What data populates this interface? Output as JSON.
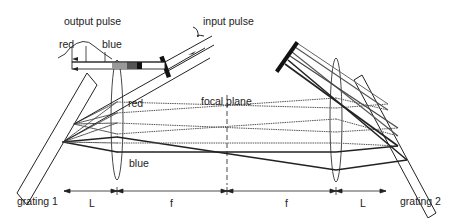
{
  "diagram": {
    "type": "optical-schematic",
    "labels": {
      "output_pulse": "output pulse",
      "input_pulse": "input pulse",
      "red_output": "red",
      "blue_output": "blue",
      "red_beam": "red",
      "blue_beam": "blue",
      "focal_plane": "focal plane",
      "grating_1": "grating 1",
      "grating_2": "grating 2",
      "dim_L_left": "L",
      "dim_f_left": "f",
      "dim_f_right": "f",
      "dim_L_right": "L"
    },
    "components": [
      {
        "id": "grating-1",
        "kind": "diffraction grating"
      },
      {
        "id": "lens-1",
        "kind": "lens"
      },
      {
        "id": "focal-plane",
        "kind": "plane (dashed)"
      },
      {
        "id": "lens-2",
        "kind": "lens"
      },
      {
        "id": "grating-2",
        "kind": "diffraction grating"
      },
      {
        "id": "input-mirror",
        "kind": "mirror"
      },
      {
        "id": "retro-mirror",
        "kind": "mirror"
      }
    ],
    "dimensions": [
      "L",
      "f",
      "f",
      "L"
    ],
    "colors": {
      "line": "#1a1a1a",
      "ray_gray": "#555555",
      "background": "#ffffff"
    }
  }
}
